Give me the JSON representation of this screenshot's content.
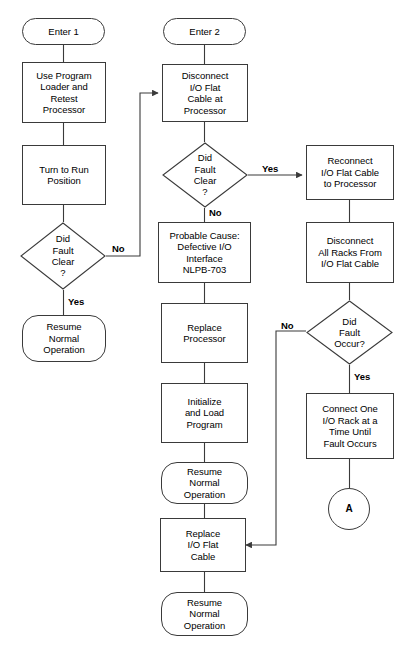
{
  "diagram": {
    "width": 407,
    "height": 647,
    "stroke_color": "#3a3a3a",
    "text_color": "#000000",
    "background": "#ffffff"
  },
  "nodes": {
    "enter_1": {
      "label": "Enter 1",
      "shape": "terminator"
    },
    "use_program_loader": {
      "label": "Use Program\nLoader and\nRetest\nProcessor",
      "shape": "process"
    },
    "turn_to_run": {
      "label": "Turn to Run\nPosition",
      "shape": "process"
    },
    "did_fault_clear_left": {
      "label": "Did\nFault\nClear\n?",
      "shape": "decision"
    },
    "resume_left": {
      "label": "Resume\nNormal\nOperation",
      "shape": "terminator"
    },
    "enter_2": {
      "label": "Enter 2",
      "shape": "terminator"
    },
    "disconnect_io_cable": {
      "label": "Disconnect\nI/O Flat\nCable at\nProcessor",
      "shape": "process"
    },
    "did_fault_clear_mid": {
      "label": "Did\nFault\nClear\n?",
      "shape": "decision"
    },
    "probable_cause": {
      "label": "Probable Cause:\nDefective I/O\nInterface\nNLPB-703",
      "shape": "process"
    },
    "replace_processor": {
      "label": "Replace\nProcessor",
      "shape": "process"
    },
    "initialize_and_load": {
      "label": "Initialize\nand Load\nProgram",
      "shape": "process"
    },
    "resume_mid": {
      "label": "Resume\nNormal\nOperation",
      "shape": "terminator"
    },
    "replace_io_cable": {
      "label": "Replace\nI/O Flat\nCable",
      "shape": "process"
    },
    "resume_bottom": {
      "label": "Resume\nNormal\nOperation",
      "shape": "terminator"
    },
    "reconnect_io_cable": {
      "label": "Reconnect\nI/O Flat Cable\nto Processor",
      "shape": "process"
    },
    "disconnect_all_racks": {
      "label": "Disconnect\nAll Racks From\nI/O Flat Cable",
      "shape": "process"
    },
    "did_fault_occur": {
      "label": "Did\nFault\nOccur?",
      "shape": "decision"
    },
    "connect_one_rack": {
      "label": "Connect One\nI/O Rack at a\nTime Until\nFault Occurs",
      "shape": "process"
    },
    "connector_a": {
      "label": "A",
      "shape": "connector"
    }
  },
  "edge_labels": {
    "left_no": "No",
    "left_yes": "Yes",
    "mid_yes": "Yes",
    "mid_no": "No",
    "right_no": "No",
    "right_yes": "Yes"
  }
}
